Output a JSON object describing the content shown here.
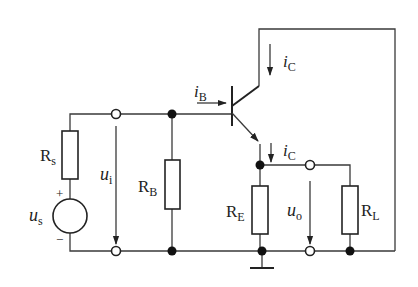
{
  "diagram": {
    "type": "circuit",
    "components": {
      "Rs": {
        "label": "R",
        "sub": "s"
      },
      "us": {
        "label": "u",
        "sub": "s",
        "plus": "+",
        "minus": "−"
      },
      "RB": {
        "label": "R",
        "sub": "B"
      },
      "RE": {
        "label": "R",
        "sub": "E"
      },
      "RL": {
        "label": "R",
        "sub": "L"
      },
      "transistor": {
        "type": "NPN BJT"
      }
    },
    "signals": {
      "ui": {
        "label": "u",
        "sub": "i"
      },
      "uo": {
        "label": "u",
        "sub": "o"
      },
      "iB": {
        "label": "i",
        "sub": "B"
      },
      "iC_top": {
        "label": "i",
        "sub": "C"
      },
      "iC_emitter": {
        "label": "i",
        "sub": "C"
      }
    },
    "colors": {
      "line": "#222222",
      "background": "#ffffff"
    }
  }
}
